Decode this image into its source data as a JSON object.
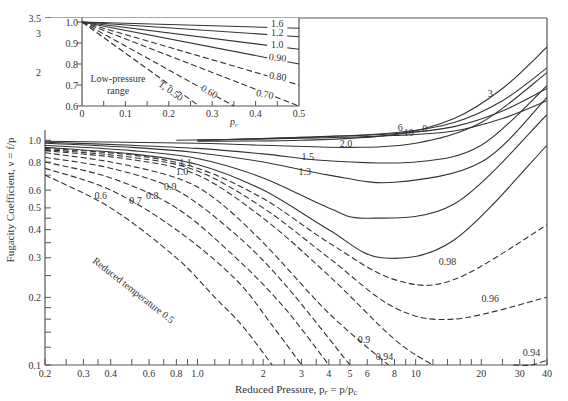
{
  "chart_data": {
    "type": "line",
    "title": "",
    "xlabel": "Reduced Pressure, p_r = p/p_c",
    "ylabel": "Fugacity Coefficient, ν = f/p",
    "xscale": "log",
    "yscale": "log",
    "xlim": [
      0.2,
      40
    ],
    "ylim": [
      0.1,
      3.5
    ],
    "grid": false,
    "legend": "none (curves labeled inline by reduced temperature T_r)",
    "x_ticks": [
      "0.2",
      "0.3",
      "0.4",
      "0.6",
      "0.8",
      "1.0",
      "2",
      "3",
      "4",
      "5",
      "6",
      "8",
      "10",
      "20",
      "30",
      "40"
    ],
    "y_ticks": [
      "0.1",
      "0.2",
      "0.3",
      "0.4",
      "0.5",
      "0.6",
      "0.8",
      "1.0",
      "2",
      "3",
      "3.5"
    ],
    "annotations": [
      "Reduced temperature 0.5"
    ],
    "series": [
      {
        "name": "0.5",
        "style": "dashed",
        "x": [
          0.2,
          0.4,
          0.8,
          1.2,
          1.6,
          2.2
        ],
        "y": [
          0.7,
          0.5,
          0.3,
          0.2,
          0.15,
          0.1
        ]
      },
      {
        "name": "0.6",
        "style": "dashed",
        "x": [
          0.2,
          0.4,
          0.8,
          1.5,
          2.2,
          3.0
        ],
        "y": [
          0.75,
          0.6,
          0.4,
          0.24,
          0.15,
          0.1
        ]
      },
      {
        "name": "0.7",
        "style": "dashed",
        "x": [
          0.2,
          0.4,
          0.8,
          1.5,
          2.5,
          4.0
        ],
        "y": [
          0.8,
          0.68,
          0.5,
          0.3,
          0.18,
          0.1
        ]
      },
      {
        "name": "0.8",
        "style": "dashed",
        "x": [
          0.2,
          0.4,
          0.8,
          1.5,
          2.5,
          5.0
        ],
        "y": [
          0.84,
          0.75,
          0.6,
          0.38,
          0.23,
          0.1
        ]
      },
      {
        "name": "0.9",
        "style": "dashed",
        "x": [
          0.2,
          0.4,
          0.8,
          1.2,
          2,
          4,
          7.5
        ],
        "y": [
          0.88,
          0.8,
          0.68,
          0.55,
          0.35,
          0.17,
          0.1
        ]
      },
      {
        "name": "0.94",
        "style": "dashed",
        "x": [
          0.2,
          0.5,
          1.0,
          2,
          4,
          8,
          12
        ],
        "y": [
          0.9,
          0.82,
          0.7,
          0.45,
          0.25,
          0.13,
          0.1
        ]
      },
      {
        "name": "0.96",
        "style": "dashed",
        "x": [
          0.2,
          0.5,
          1.0,
          2,
          4,
          8,
          15,
          40
        ],
        "y": [
          0.91,
          0.84,
          0.73,
          0.5,
          0.3,
          0.18,
          0.16,
          0.2
        ]
      },
      {
        "name": "0.98",
        "style": "dashed",
        "x": [
          0.2,
          0.5,
          1.0,
          2,
          4,
          8,
          15,
          40
        ],
        "y": [
          0.92,
          0.86,
          0.75,
          0.55,
          0.35,
          0.24,
          0.24,
          0.42
        ]
      },
      {
        "name": "1.0",
        "style": "solid",
        "x": [
          0.2,
          0.5,
          1.0,
          2,
          4,
          7,
          15,
          40
        ],
        "y": [
          0.93,
          0.87,
          0.78,
          0.6,
          0.4,
          0.3,
          0.36,
          0.95
        ]
      },
      {
        "name": "1.1",
        "style": "solid",
        "x": [
          0.2,
          0.5,
          1.0,
          2,
          4,
          6,
          15,
          40
        ],
        "y": [
          0.95,
          0.9,
          0.83,
          0.68,
          0.5,
          0.45,
          0.52,
          1.3
        ]
      },
      {
        "name": "1.3",
        "style": "solid",
        "x": [
          0.2,
          0.5,
          1.0,
          2,
          4,
          8,
          20,
          40
        ],
        "y": [
          0.97,
          0.93,
          0.88,
          0.8,
          0.7,
          0.65,
          0.8,
          1.55
        ]
      },
      {
        "name": "1.5",
        "style": "solid",
        "x": [
          0.2,
          0.5,
          1.0,
          2,
          4,
          10,
          20,
          40
        ],
        "y": [
          0.98,
          0.95,
          0.92,
          0.87,
          0.81,
          0.8,
          0.95,
          1.75
        ]
      },
      {
        "name": "2.0",
        "style": "solid",
        "x": [
          0.2,
          1.0,
          2,
          5,
          10,
          20,
          40
        ],
        "y": [
          0.99,
          0.97,
          0.95,
          0.93,
          0.97,
          1.2,
          2.0
        ]
      },
      {
        "name": "10",
        "style": "solid",
        "x": [
          0.8,
          3,
          8,
          15,
          25,
          40
        ],
        "y": [
          1.0,
          1.02,
          1.05,
          1.1,
          1.25,
          1.5
        ]
      },
      {
        "name": "8",
        "style": "solid",
        "x": [
          1.0,
          3,
          8,
          15,
          25,
          40
        ],
        "y": [
          1.0,
          1.03,
          1.07,
          1.15,
          1.35,
          1.7
        ]
      },
      {
        "name": "6",
        "style": "solid",
        "x": [
          1.0,
          3,
          8,
          15,
          25,
          40
        ],
        "y": [
          1.0,
          1.03,
          1.08,
          1.2,
          1.5,
          2.1
        ]
      },
      {
        "name": "3",
        "style": "solid",
        "x": [
          1.0,
          3,
          8,
          15,
          25,
          40
        ],
        "y": [
          0.99,
          1.0,
          1.06,
          1.25,
          1.7,
          2.6
        ]
      }
    ],
    "inset": {
      "title": "Low-pressure range",
      "xlabel": "p_r",
      "xlim": [
        0,
        0.5
      ],
      "ylim": [
        0.6,
        1.0
      ],
      "x_ticks": [
        "0",
        "0.1",
        "0.2",
        "0.3",
        "0.4",
        "0.5"
      ],
      "y_ticks": [
        "0.6",
        "0.7",
        "0.8",
        "0.9",
        "1.0"
      ],
      "series": [
        {
          "name": "T_r 0.50",
          "style": "dashed",
          "x": [
            0,
            0.27
          ],
          "y": [
            1.0,
            0.6
          ]
        },
        {
          "name": "0.60",
          "style": "dashed",
          "x": [
            0,
            0.35
          ],
          "y": [
            1.0,
            0.6
          ]
        },
        {
          "name": "0.70",
          "style": "dashed",
          "x": [
            0,
            0.5
          ],
          "y": [
            1.0,
            0.6
          ]
        },
        {
          "name": "0.80",
          "style": "dashed",
          "x": [
            0,
            0.5
          ],
          "y": [
            1.0,
            0.7
          ]
        },
        {
          "name": "0.90",
          "style": "solid",
          "x": [
            0,
            0.5
          ],
          "y": [
            1.0,
            0.8
          ]
        },
        {
          "name": "1.0",
          "style": "solid",
          "x": [
            0,
            0.5
          ],
          "y": [
            1.0,
            0.87
          ]
        },
        {
          "name": "1.2",
          "style": "solid",
          "x": [
            0,
            0.5
          ],
          "y": [
            1.0,
            0.93
          ]
        },
        {
          "name": "1.6",
          "style": "solid",
          "x": [
            0,
            0.5
          ],
          "y": [
            1.0,
            0.97
          ]
        }
      ]
    }
  },
  "labels": {
    "xlabel": "Reduced Pressure, p",
    "xlabel_sub": "r",
    "xlabel_rest": " = p/p",
    "xlabel_sub2": "c",
    "ylabel": "Fugacity Coefficient, ν = f/p",
    "inset_title_1": "Low-pressure",
    "inset_title_2": "range",
    "inset_xlabel": "p",
    "inset_xlabel_sub": "r",
    "reduced_temp": "Reduced temperature 0.5"
  }
}
